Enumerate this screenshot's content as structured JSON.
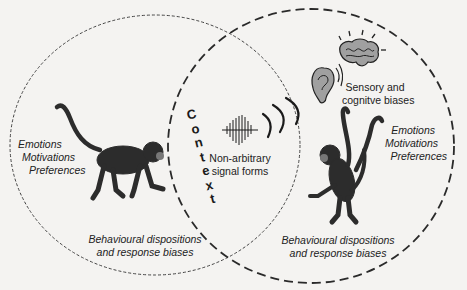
{
  "diagram": {
    "left_circle": {
      "agent": "signaller monkey (walking)",
      "traits": [
        "Emotions",
        "Motivations",
        "Preferences"
      ],
      "dispositions": [
        "Behavioural dispositions",
        "and response biases"
      ]
    },
    "right_circle": {
      "agent": "receiver monkey (standing, arms raised)",
      "biases": [
        "Sensory and",
        "cognitve biases"
      ],
      "traits": [
        "Emotions",
        "Motivations",
        "Preferences"
      ],
      "dispositions": [
        "Behavioural dispositions",
        "and response biases"
      ]
    },
    "overlap": {
      "context_letters": [
        "C",
        "o",
        "n",
        "t",
        "e",
        "x",
        "t"
      ],
      "signal": [
        "Non-arbitrary",
        "signal forms"
      ]
    },
    "icons": [
      "monkey-left",
      "monkey-right",
      "waveform",
      "sound-waves",
      "ear",
      "brain"
    ],
    "colors": {
      "ink": "#2a2a2a",
      "background": "#f4f3f1",
      "ear_fill": "#9a9a9a"
    }
  }
}
